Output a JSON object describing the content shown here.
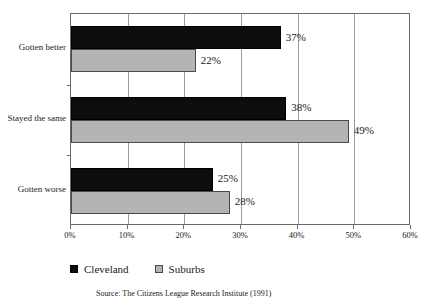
{
  "chart_data": {
    "type": "bar",
    "orientation": "horizontal",
    "title": "",
    "xlabel": "",
    "ylabel": "",
    "categories": [
      "Gotten better",
      "Stayed the same",
      "Gotten worse"
    ],
    "series": [
      {
        "name": "Cleveland",
        "color": "#0d0d0d",
        "values": [
          37,
          38,
          25
        ],
        "labels": [
          "37%",
          "38%",
          "25%"
        ]
      },
      {
        "name": "Suburbs",
        "color": "#b4b4b4",
        "values": [
          22,
          49,
          28
        ],
        "labels": [
          "22%",
          "49%",
          "28%"
        ]
      }
    ],
    "xlim": [
      0,
      60
    ],
    "xticks": [
      0,
      10,
      20,
      30,
      40,
      50,
      60
    ],
    "xtick_labels": [
      "0%",
      "10%",
      "20%",
      "30%",
      "40%",
      "50%",
      "60%"
    ],
    "grid": true,
    "grid_axis": "x",
    "legend_position": "bottom-left",
    "value_labels_shown": true
  },
  "legend": {
    "entries": [
      {
        "label": "Cleveland"
      },
      {
        "label": "Suburbs"
      }
    ]
  },
  "source": {
    "text": "Source: The Citizens League Research Institute (1991)"
  }
}
